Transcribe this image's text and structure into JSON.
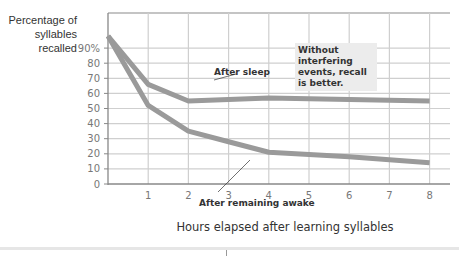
{
  "chart_data": {
    "type": "line",
    "title": "",
    "xlabel": "Hours elapsed after learning syllables",
    "ylabel": "Percentage of syllables recalled",
    "ylabel_lines": [
      "Percentage of",
      "syllables",
      "recalled"
    ],
    "x_ticks": [
      "1",
      "2",
      "3",
      "4",
      "5",
      "6",
      "7",
      "8"
    ],
    "y_ticks": [
      "0",
      "10",
      "20",
      "30",
      "40",
      "50",
      "60",
      "70",
      "80",
      "90%"
    ],
    "xlim": [
      0,
      8.5
    ],
    "ylim": [
      0,
      100
    ],
    "grid": true,
    "series": [
      {
        "name": "After sleep",
        "x": [
          0,
          1,
          2,
          4,
          8
        ],
        "values": [
          98,
          66,
          55,
          57,
          55
        ]
      },
      {
        "name": "After remaining awake",
        "x": [
          0,
          1,
          2,
          3,
          4,
          6,
          8
        ],
        "values": [
          98,
          52,
          35,
          28,
          21,
          18,
          14
        ]
      }
    ],
    "annotations": [
      {
        "text": "After sleep",
        "target_series": "After sleep"
      },
      {
        "text": "After remaining awake",
        "target_series": "After remaining awake"
      },
      {
        "text": "Without interfering events, recall is better."
      }
    ]
  },
  "labels": {
    "sleep": "After sleep",
    "awake": "After remaining awake",
    "note": "Without interfering events, recall is better."
  },
  "colors": {
    "line": "#9a9a9a",
    "grid": "#cfcfcf",
    "note_bg": "#ececec"
  }
}
